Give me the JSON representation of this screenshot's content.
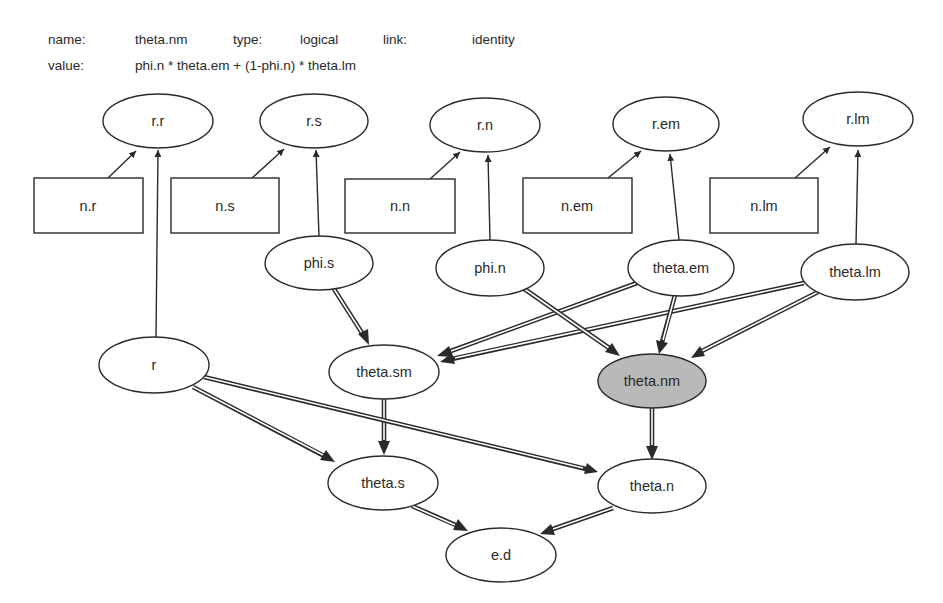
{
  "properties": {
    "name_label": "name:",
    "name_value": "theta.nm",
    "type_label": "type:",
    "type_value": "logical",
    "link_label": "link:",
    "link_value": "identity",
    "value_label": "value:",
    "value_expr": "phi.n * theta.em + (1-phi.n) * theta.lm"
  },
  "colors": {
    "stroke": "#2a2a2a",
    "selected_fill": "#b9b9b9",
    "node_fill": "#ffffff"
  },
  "nodes": {
    "r_r": {
      "label": "r.r",
      "shape": "ellipse"
    },
    "r_s": {
      "label": "r.s",
      "shape": "ellipse"
    },
    "r_n": {
      "label": "r.n",
      "shape": "ellipse"
    },
    "r_em": {
      "label": "r.em",
      "shape": "ellipse"
    },
    "r_lm": {
      "label": "r.lm",
      "shape": "ellipse"
    },
    "n_r": {
      "label": "n.r",
      "shape": "rect"
    },
    "n_s": {
      "label": "n.s",
      "shape": "rect"
    },
    "n_n": {
      "label": "n.n",
      "shape": "rect"
    },
    "n_em": {
      "label": "n.em",
      "shape": "rect"
    },
    "n_lm": {
      "label": "n.lm",
      "shape": "rect"
    },
    "phi_s": {
      "label": "phi.s",
      "shape": "ellipse"
    },
    "phi_n": {
      "label": "phi.n",
      "shape": "ellipse"
    },
    "theta_em": {
      "label": "theta.em",
      "shape": "ellipse"
    },
    "theta_lm": {
      "label": "theta.lm",
      "shape": "ellipse"
    },
    "r": {
      "label": "r",
      "shape": "ellipse"
    },
    "theta_sm": {
      "label": "theta.sm",
      "shape": "ellipse"
    },
    "theta_nm": {
      "label": "theta.nm",
      "shape": "ellipse",
      "selected": true
    },
    "theta_s": {
      "label": "theta.s",
      "shape": "ellipse"
    },
    "theta_n": {
      "label": "theta.n",
      "shape": "ellipse"
    },
    "e_d": {
      "label": "e.d",
      "shape": "ellipse"
    }
  },
  "edges": [
    {
      "from": "n.r",
      "to": "r.r",
      "style": "stochastic"
    },
    {
      "from": "r",
      "to": "r.r",
      "style": "stochastic"
    },
    {
      "from": "n.s",
      "to": "r.s",
      "style": "stochastic"
    },
    {
      "from": "phi.s",
      "to": "r.s",
      "style": "stochastic"
    },
    {
      "from": "n.n",
      "to": "r.n",
      "style": "stochastic"
    },
    {
      "from": "phi.n",
      "to": "r.n",
      "style": "stochastic"
    },
    {
      "from": "n.em",
      "to": "r.em",
      "style": "stochastic"
    },
    {
      "from": "theta.em",
      "to": "r.em",
      "style": "stochastic"
    },
    {
      "from": "n.lm",
      "to": "r.lm",
      "style": "stochastic"
    },
    {
      "from": "theta.lm",
      "to": "r.lm",
      "style": "stochastic"
    },
    {
      "from": "phi.s",
      "to": "theta.sm",
      "style": "logical"
    },
    {
      "from": "theta.em",
      "to": "theta.sm",
      "style": "logical"
    },
    {
      "from": "theta.lm",
      "to": "theta.sm",
      "style": "logical"
    },
    {
      "from": "phi.n",
      "to": "theta.nm",
      "style": "logical"
    },
    {
      "from": "theta.em",
      "to": "theta.nm",
      "style": "logical"
    },
    {
      "from": "theta.lm",
      "to": "theta.nm",
      "style": "logical"
    },
    {
      "from": "theta.sm",
      "to": "theta.s",
      "style": "logical"
    },
    {
      "from": "r",
      "to": "theta.s",
      "style": "logical"
    },
    {
      "from": "r",
      "to": "theta.n",
      "style": "logical"
    },
    {
      "from": "theta.nm",
      "to": "theta.n",
      "style": "logical"
    },
    {
      "from": "theta.s",
      "to": "e.d",
      "style": "logical"
    },
    {
      "from": "theta.n",
      "to": "e.d",
      "style": "logical"
    }
  ]
}
